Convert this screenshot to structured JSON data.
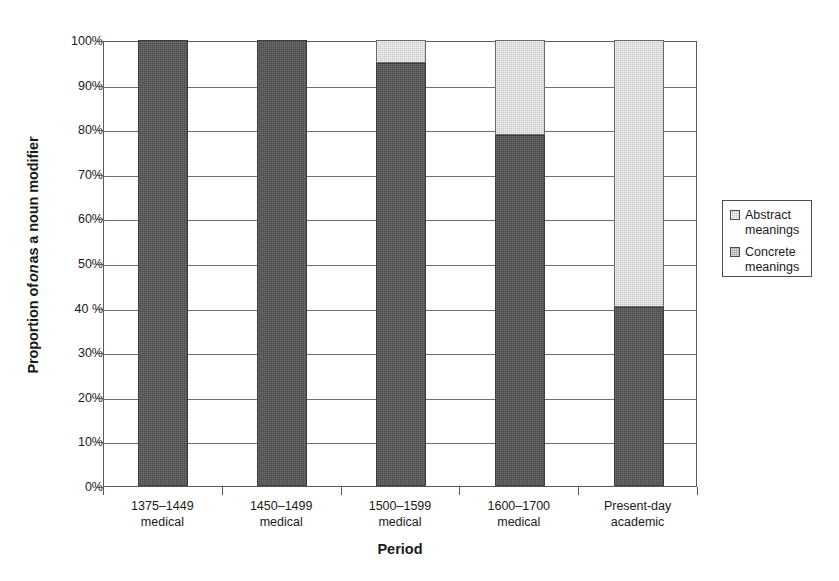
{
  "chart_data": {
    "type": "bar",
    "subtype": "stacked-100-percent",
    "title": "",
    "xlabel": "Period",
    "ylabel": "Proportion of on as a noun modifier",
    "ylabel_parts": {
      "before": "Proportion of ",
      "italic": "on",
      "after": " as a noun modifier"
    },
    "categories": [
      "1375–1449\nmedical",
      "1450–1499\nmedical",
      "1500–1599\nmedical",
      "1600–1700\nmedical",
      "Present-day\nacademic"
    ],
    "category_lines": [
      [
        "1375–1449",
        "medical"
      ],
      [
        "1450–1499",
        "medical"
      ],
      [
        "1500–1599",
        "medical"
      ],
      [
        "1600–1700",
        "medical"
      ],
      [
        "Present-day",
        "academic"
      ]
    ],
    "series": [
      {
        "name": "Concrete meanings",
        "color": "#4a4a4a",
        "values": [
          100,
          100,
          94.8,
          78.6,
          40.2
        ]
      },
      {
        "name": "Abstract meanings",
        "color": "#c8c8c8",
        "values": [
          0,
          0,
          5.2,
          21.4,
          59.8
        ]
      }
    ],
    "ylim": [
      0,
      100
    ],
    "ytick_values": [
      0,
      10,
      20,
      30,
      40,
      50,
      60,
      70,
      80,
      90,
      100
    ],
    "ytick_labels": [
      "0%",
      "10%",
      "20%",
      "30%",
      "40 %",
      "50%",
      "60%",
      "70%",
      "80%",
      "90%",
      "100%"
    ],
    "grid": true,
    "legend_position": "right",
    "legend": [
      {
        "label_line1": "Abstract",
        "label_line2": "meanings",
        "swatch": "abstract-swatch"
      },
      {
        "label_line1": "Concrete",
        "label_line2": "meanings",
        "swatch": "concrete-swatch"
      }
    ]
  }
}
